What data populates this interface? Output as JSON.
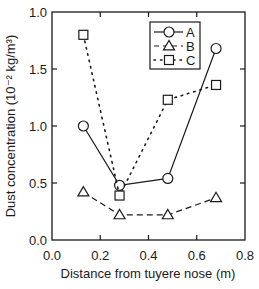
{
  "chart_data": {
    "type": "line",
    "title": "",
    "xlabel": "Distance from tuyere nose (m)",
    "ylabel": "Dust concentration (10⁻² kg/m³)",
    "xlim": [
      0.0,
      0.8
    ],
    "ylim": [
      0.0,
      2.0
    ],
    "xticks": [
      0.0,
      0.2,
      0.4,
      0.6,
      0.8
    ],
    "xtick_labels": [
      "0.0",
      "0.2",
      "0.4",
      "0.6",
      "0.8"
    ],
    "yticks": [
      0.0,
      0.5,
      1.0,
      1.5,
      2.0
    ],
    "ytick_labels": [
      "0.0",
      "0.5",
      "1.0",
      "1.5",
      "1.0"
    ],
    "grid": false,
    "legend_position": "top-right",
    "x": [
      0.13,
      0.28,
      0.48,
      0.68
    ],
    "series": [
      {
        "name": "A",
        "marker": "circle",
        "line": "solid",
        "values": [
          1.0,
          0.48,
          0.54,
          1.68
        ]
      },
      {
        "name": "B",
        "marker": "triangle",
        "line": "dashed",
        "values": [
          0.42,
          0.22,
          0.22,
          0.37
        ]
      },
      {
        "name": "C",
        "marker": "square",
        "line": "dotted",
        "values": [
          1.8,
          0.39,
          1.23,
          1.36
        ]
      }
    ]
  },
  "colors": {
    "ink": "#1a1a1a",
    "background": "#ffffff"
  }
}
